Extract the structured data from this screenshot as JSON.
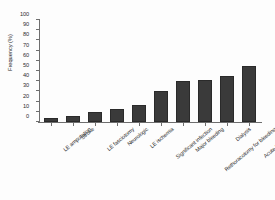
{
  "chart_data": {
    "type": "bar",
    "title": "",
    "xlabel": "",
    "ylabel": "Frequency (%)",
    "ylim": [
      0,
      100
    ],
    "yticks": [
      0,
      10,
      20,
      30,
      40,
      50,
      60,
      70,
      80,
      90,
      100
    ],
    "grid": false,
    "legend": "none",
    "bar_color": "#3a3a3a",
    "axis_color": "#6e6e6e",
    "categories": [
      "LE amputation",
      "Stroke",
      "LE fasciotomy",
      "Neurologic",
      "LE ischemia",
      "Significant infection",
      "Major bleeding",
      "Rethoracotomy for bleeding",
      "Dialysis",
      "Acute kidney injury"
    ],
    "values": [
      4,
      5.5,
      10,
      13,
      16.5,
      30,
      40,
      41,
      45.5,
      55
    ]
  }
}
